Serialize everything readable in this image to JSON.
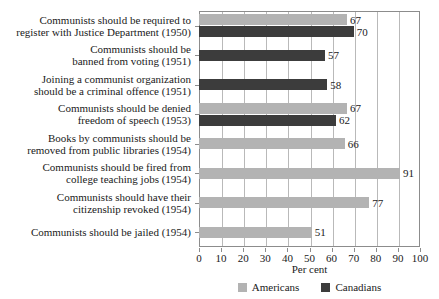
{
  "chart_data": {
    "type": "bar",
    "orientation": "horizontal",
    "title": "",
    "xlabel": "Per cent",
    "ylabel": "",
    "xlim": [
      0,
      100
    ],
    "xticks": [
      0,
      10,
      20,
      30,
      40,
      50,
      60,
      70,
      80,
      90,
      100
    ],
    "grid": "vertical",
    "legend_position": "bottom",
    "categories": [
      "Communists should be required to register with Justice Department (1950)",
      "Communists should be banned from voting (1951)",
      "Joining a communist organization should be a criminal offence (1951)",
      "Communists should be denied freedom of speech (1953)",
      "Books by communists should be removed from public libraries (1954)",
      "Communists should be fired from college teaching jobs (1954)",
      "Communists should have their citizenship revoked (1954)",
      "Communists should be jailed (1954)"
    ],
    "category_lines": [
      [
        "Communists should be required to",
        "register with Justice Department (1950)"
      ],
      [
        "Communists should be",
        "banned from voting (1951)"
      ],
      [
        "Joining a communist organization",
        "should be a criminal offence (1951)"
      ],
      [
        "Communists should be denied",
        "freedom of speech (1953)"
      ],
      [
        "Books by communists should be",
        "removed from public libraries (1954)"
      ],
      [
        "Communists should be fired from",
        "college teaching jobs (1954)"
      ],
      [
        "Communists should have their",
        "citizenship revoked (1954)"
      ],
      [
        "Communists should be jailed (1954)"
      ]
    ],
    "series": [
      {
        "name": "Americans",
        "color": "#b3b3b3",
        "values": [
          67,
          null,
          null,
          67,
          66,
          91,
          77,
          51
        ]
      },
      {
        "name": "Canadians",
        "color": "#3c3c3c",
        "values": [
          70,
          57,
          58,
          62,
          null,
          null,
          null,
          null
        ]
      }
    ]
  },
  "axis": {
    "title": "Per cent",
    "ticks": [
      "0",
      "10",
      "20",
      "30",
      "40",
      "50",
      "60",
      "70",
      "80",
      "90",
      "100"
    ]
  },
  "legend": {
    "items": [
      {
        "label": "Americans",
        "color": "#b3b3b3"
      },
      {
        "label": "Canadians",
        "color": "#3c3c3c"
      }
    ]
  }
}
